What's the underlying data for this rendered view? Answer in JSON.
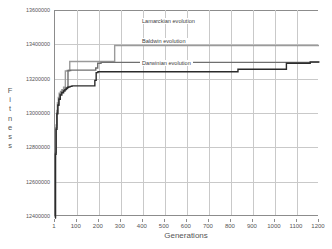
{
  "chart_data": {
    "type": "line",
    "title": "",
    "xlabel": "Generations",
    "ylabel": "Fitness",
    "xlim": [
      1,
      1200
    ],
    "ylim": [
      12400000,
      13600000
    ],
    "grid": true,
    "legend_position": "inline-annotations",
    "x_ticks": [
      "1",
      "100",
      "200",
      "300",
      "400",
      "500",
      "600",
      "700",
      "800",
      "900",
      "1000",
      "1100",
      "1200"
    ],
    "x_tick_values": [
      1,
      100,
      200,
      300,
      400,
      500,
      600,
      700,
      800,
      900,
      1000,
      1100,
      1200
    ],
    "y_ticks": [
      "12400000",
      "12600000",
      "12800000",
      "13000000",
      "13200000",
      "13400000",
      "13600000"
    ],
    "y_tick_values": [
      12400000,
      12600000,
      12800000,
      13000000,
      13200000,
      13400000,
      13600000
    ],
    "series": [
      {
        "name": "Lamarckian evolution",
        "color": "#9a9a9a",
        "x": [
          1,
          3,
          6,
          9,
          12,
          16,
          20,
          26,
          32,
          40,
          48,
          56,
          62,
          68,
          75,
          120,
          185,
          200,
          268,
          272,
          600,
          900,
          1200
        ],
        "values": [
          12395000,
          12790000,
          12930000,
          13015000,
          13060000,
          13090000,
          13115000,
          13125000,
          13135000,
          13150000,
          13245000,
          13248000,
          13250000,
          13300000,
          13300000,
          13300000,
          13300000,
          13300000,
          13300000,
          13393000,
          13393000,
          13393000,
          13393000
        ]
      },
      {
        "name": "Baldwin evolution",
        "color": "#6f6f6f",
        "x": [
          1,
          3,
          6,
          9,
          13,
          18,
          24,
          30,
          38,
          46,
          52,
          60,
          66,
          72,
          100,
          150,
          180,
          186,
          195,
          210,
          400,
          700,
          1000,
          1200
        ],
        "values": [
          12392000,
          12770000,
          12915000,
          13000000,
          13050000,
          13085000,
          13110000,
          13122000,
          13132000,
          13140000,
          13148000,
          13246000,
          13248000,
          13250000,
          13250000,
          13250000,
          13250000,
          13262000,
          13290000,
          13295000,
          13295000,
          13295000,
          13295000,
          13295000
        ]
      },
      {
        "name": "Darwinian evolution",
        "color": "#2b2b2b",
        "x": [
          1,
          3,
          6,
          10,
          14,
          19,
          25,
          32,
          40,
          46,
          52,
          58,
          64,
          70,
          78,
          100,
          140,
          175,
          182,
          188,
          196,
          300,
          500,
          700,
          826,
          832,
          1000,
          1046,
          1052,
          1120,
          1160,
          1200
        ],
        "values": [
          12388000,
          12760000,
          12905000,
          12995000,
          13045000,
          13080000,
          13105000,
          13118000,
          13128000,
          13136000,
          13143000,
          13150000,
          13152000,
          13155000,
          13158000,
          13158000,
          13158000,
          13158000,
          13190000,
          13235000,
          13240000,
          13240000,
          13240000,
          13240000,
          13240000,
          13255000,
          13255000,
          13255000,
          13290000,
          13290000,
          13298000,
          13300000
        ]
      }
    ],
    "annotations": [
      {
        "text": "Lamarckian evolution",
        "x_px": 140,
        "y_px": 18
      },
      {
        "text": "Baldwin evolution",
        "x_px": 140,
        "y_px": 38
      },
      {
        "text": "Darwinian evolution",
        "x_px": 140,
        "y_px": 60
      }
    ]
  }
}
